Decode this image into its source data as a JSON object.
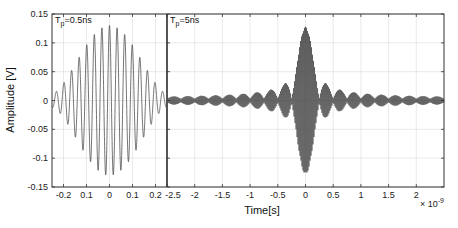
{
  "chart_data": [
    {
      "type": "line",
      "panel": "left",
      "annotation": {
        "main": "T",
        "sub": "p",
        "rest": "=0.5ns"
      },
      "xlabel": "",
      "ylabel": "Amplitude [V]",
      "xlim": [
        -0.25,
        0.25
      ],
      "x_unit": "ns",
      "ylim": [
        -0.15,
        0.15
      ],
      "xticks": [
        -0.2,
        -0.1,
        0,
        0.1,
        0.2
      ],
      "xtick_labels": [
        "-0.2",
        "0.1",
        "0",
        "0.1",
        "0.2"
      ],
      "yticks": [
        0.15,
        0.1,
        0.05,
        0,
        -0.05,
        -0.1,
        -0.15
      ],
      "ytick_labels": [
        "0.15",
        "0.1",
        "0.05",
        "0",
        "-0.05",
        "-0.1",
        "-0.15"
      ],
      "grid": true,
      "series": [
        {
          "name": "Tp=0.5ns pulse",
          "carrier_period_ns": 0.033,
          "peak_amplitude": 0.13,
          "envelope": "windowed cosine over pulse width 0.5 ns"
        }
      ]
    },
    {
      "type": "line",
      "panel": "right",
      "annotation": {
        "main": "T",
        "sub": "p",
        "rest": "=5ns"
      },
      "xlabel": "Time[s]",
      "x_multiplier": "× 10",
      "x_multiplier_exp": "-9",
      "xlim": [
        -2.5,
        2.5
      ],
      "ylim": [
        -0.15,
        0.15
      ],
      "xticks": [
        -2.5,
        -2,
        -1.5,
        -1,
        -0.5,
        0,
        0.5,
        1,
        1.5,
        2
      ],
      "xtick_labels": [
        "-2.5",
        "-2",
        "-1.5",
        "-1",
        "-0.5",
        "0",
        "0.5",
        "1",
        "1.5",
        "2"
      ],
      "grid": true,
      "series": [
        {
          "name": "Tp=5ns compressed pulse",
          "peak_amplitude": 0.125,
          "envelope": "sinc",
          "mainlobe_null_ns": 0.25,
          "first_sidelobe_amplitude": 0.03
        }
      ]
    }
  ],
  "figure": {
    "colors": {
      "axis": "#333333",
      "grid": "#dcdcdc",
      "trace": "#3a3a3a",
      "divider": "#555555"
    }
  }
}
